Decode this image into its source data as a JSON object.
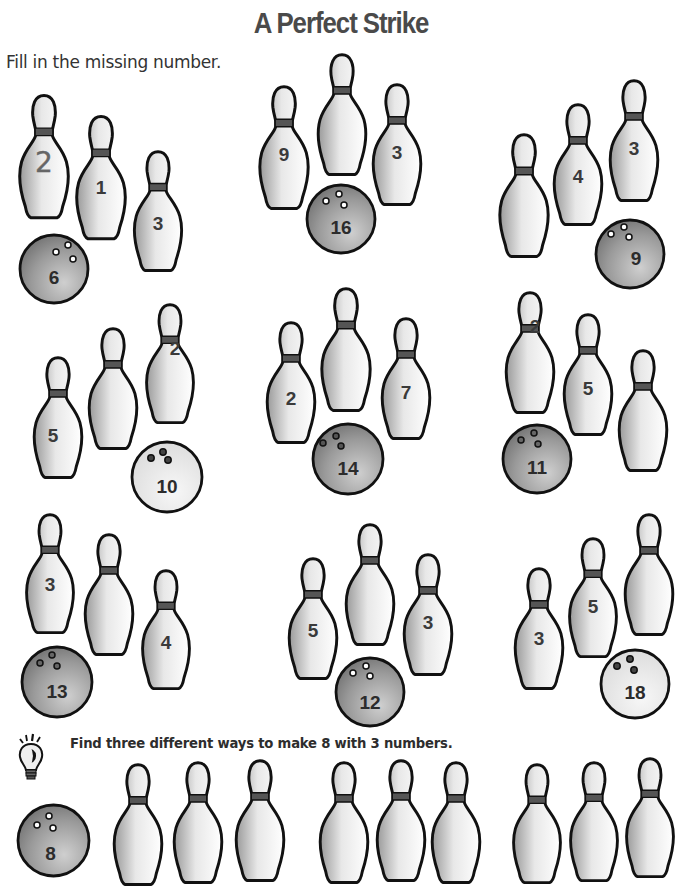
{
  "title": "A Perfect Strike",
  "instructions": "Fill in the missing number.",
  "bonus_prompt": "Find three different ways to make 8 with 3 numbers.",
  "colors": {
    "outline": "#111111",
    "pin_band": "#555555",
    "ball_dark": "#8a8a8a",
    "ball_light": "#e6e6e6",
    "title": "#4a4a4a"
  },
  "problems": [
    {
      "id": 1,
      "total": "6",
      "pins": [
        "2",
        "1",
        "3"
      ],
      "missing_index": 0,
      "example_answer": "2",
      "ball_shade": "dark"
    },
    {
      "id": 2,
      "total": "16",
      "pins": [
        "9",
        "",
        "3"
      ],
      "missing_index": 1,
      "ball_shade": "dark"
    },
    {
      "id": 3,
      "total": "9",
      "pins": [
        "",
        "4",
        "3"
      ],
      "missing_index": 0,
      "ball_shade": "dark"
    },
    {
      "id": 4,
      "total": "10",
      "pins": [
        "5",
        "",
        "2"
      ],
      "missing_index": 1,
      "ball_shade": "light"
    },
    {
      "id": 5,
      "total": "14",
      "pins": [
        "2",
        "",
        "7"
      ],
      "missing_index": 1,
      "ball_shade": "dark"
    },
    {
      "id": 6,
      "total": "11",
      "pins": [
        "2",
        "5",
        ""
      ],
      "missing_index": 2,
      "ball_shade": "dark"
    },
    {
      "id": 7,
      "total": "13",
      "pins": [
        "3",
        "",
        "4"
      ],
      "missing_index": 1,
      "ball_shade": "dark"
    },
    {
      "id": 8,
      "total": "12",
      "pins": [
        "5",
        "",
        "3"
      ],
      "missing_index": 1,
      "ball_shade": "dark"
    },
    {
      "id": 9,
      "total": "18",
      "pins": [
        "3",
        "5",
        ""
      ],
      "missing_index": 2,
      "ball_shade": "light"
    }
  ],
  "bonus": {
    "total": "8",
    "groups": [
      {
        "pins": [
          "",
          "",
          ""
        ]
      },
      {
        "pins": [
          "",
          "",
          ""
        ]
      },
      {
        "pins": [
          "",
          "",
          ""
        ]
      }
    ]
  },
  "icons": {
    "lightbulb": "lightbulb-icon",
    "bowling_pin": "bowling-pin-icon",
    "bowling_ball": "bowling-ball-icon"
  }
}
